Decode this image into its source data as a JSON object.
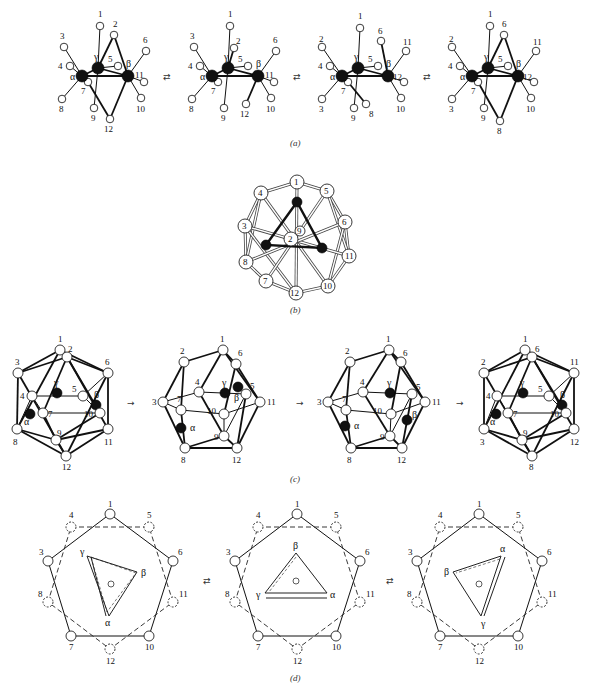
{
  "figure": {
    "captions": {
      "a": "(a)",
      "b": "(b)",
      "c": "(c)",
      "d": "(d)"
    },
    "arrows": {
      "equilibrium": "⇄",
      "forward": "→"
    }
  },
  "panel_a": {
    "caption": "(a)",
    "arrow_symbol": "⇄",
    "structures": [
      {
        "metals": {
          "alpha": "α",
          "beta": "β",
          "gamma": "γ"
        },
        "ligand_labels": [
          "1",
          "2",
          "3",
          "4",
          "5",
          "6",
          "7",
          "8",
          "9",
          "10",
          "11",
          "12"
        ]
      },
      {
        "metals": {
          "alpha": "α",
          "beta": "β",
          "gamma": "γ"
        },
        "ligand_labels": [
          "1",
          "2",
          "3",
          "4",
          "5",
          "6",
          "7",
          "8",
          "9",
          "10",
          "11",
          "12"
        ]
      },
      {
        "metals": {
          "alpha": "α",
          "beta": "β",
          "gamma": "γ"
        },
        "ligand_labels": [
          "1",
          "2",
          "3",
          "4",
          "5",
          "6",
          "7",
          "8",
          "9",
          "10",
          "11",
          "12"
        ]
      },
      {
        "metals": {
          "alpha": "α",
          "beta": "β",
          "gamma": "γ"
        },
        "ligand_labels": [
          "1",
          "2",
          "3",
          "4",
          "5",
          "6",
          "7",
          "8",
          "9",
          "10",
          "11",
          "12"
        ]
      }
    ]
  },
  "panel_b": {
    "caption": "(b)",
    "ligand_labels": [
      "1",
      "2",
      "3",
      "4",
      "5",
      "6",
      "7",
      "8",
      "9",
      "10",
      "11",
      "12"
    ]
  },
  "panel_c": {
    "caption": "(c)",
    "arrow_symbol": "→",
    "metal_labels": {
      "alpha": "α",
      "beta": "β",
      "gamma": "γ"
    },
    "ligand_labels": [
      "1",
      "2",
      "3",
      "4",
      "5",
      "6",
      "7",
      "8",
      "9",
      "10",
      "11",
      "12"
    ]
  },
  "panel_d": {
    "caption": "(d)",
    "arrow_symbol": "⇄",
    "outer_ligands_solid": [
      "1",
      "3",
      "6",
      "7",
      "10"
    ],
    "outer_ligands_dashed": [
      "4",
      "5",
      "8",
      "11",
      "12"
    ],
    "triangles": [
      {
        "vertices": [
          "γ",
          "β",
          "α"
        ]
      },
      {
        "vertices": [
          "β",
          "γ",
          "α"
        ]
      },
      {
        "vertices": [
          "α",
          "β",
          "γ"
        ]
      }
    ]
  }
}
